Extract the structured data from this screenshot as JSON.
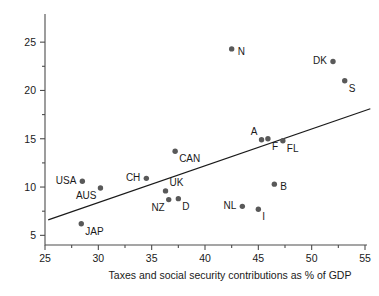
{
  "chart_data": {
    "type": "scatter",
    "title": "",
    "xlabel": "Taxes and social security contributions as % of GDP",
    "ylabel": "",
    "xlim": [
      25,
      55
    ],
    "ylim": [
      4,
      27.5
    ],
    "xticks": [
      25,
      30,
      35,
      40,
      45,
      50,
      55
    ],
    "yticks": [
      5,
      10,
      15,
      20,
      25
    ],
    "xminor": [
      27.5,
      32.5,
      37.5,
      42.5,
      47.5,
      52.5
    ],
    "yminor": [
      7.5,
      12.5,
      17.5,
      22.5
    ],
    "grid": false,
    "legend": "none",
    "points": [
      {
        "label": "USA",
        "x": 28.5,
        "y": 10.6,
        "label_pos": "left"
      },
      {
        "label": "AUS",
        "x": 30.2,
        "y": 9.9,
        "label_pos": "below-left"
      },
      {
        "label": "JAP",
        "x": 28.4,
        "y": 6.2,
        "label_pos": "below-right"
      },
      {
        "label": "CH",
        "x": 34.5,
        "y": 10.9,
        "label_pos": "left"
      },
      {
        "label": "CAN",
        "x": 37.2,
        "y": 13.7,
        "label_pos": "below-right"
      },
      {
        "label": "UK",
        "x": 36.3,
        "y": 9.6,
        "label_pos": "above-right"
      },
      {
        "label": "NZ",
        "x": 36.6,
        "y": 8.7,
        "label_pos": "below-left"
      },
      {
        "label": "D",
        "x": 37.5,
        "y": 8.8,
        "label_pos": "below-right"
      },
      {
        "label": "N",
        "x": 42.5,
        "y": 24.3,
        "label_pos": "right"
      },
      {
        "label": "NL",
        "x": 43.5,
        "y": 8.0,
        "label_pos": "left"
      },
      {
        "label": "I",
        "x": 45.0,
        "y": 7.7,
        "label_pos": "below-right"
      },
      {
        "label": "A",
        "x": 45.3,
        "y": 14.9,
        "label_pos": "above-left"
      },
      {
        "label": "F",
        "x": 45.9,
        "y": 15.0,
        "label_pos": "below-right"
      },
      {
        "label": "FL",
        "x": 47.3,
        "y": 14.8,
        "label_pos": "below-right"
      },
      {
        "label": "B",
        "x": 46.5,
        "y": 10.3,
        "label_pos": "right"
      },
      {
        "label": "DK",
        "x": 52.0,
        "y": 23.0,
        "label_pos": "left"
      },
      {
        "label": "S",
        "x": 53.1,
        "y": 21.0,
        "label_pos": "below-right"
      }
    ],
    "trendline": {
      "x0": 25.3,
      "y0": 6.6,
      "x1": 55.5,
      "y1": 18.1
    }
  },
  "colors": {
    "dot": "#595959",
    "axis": "#4d4d4d",
    "text": "#1a1a1a",
    "trend": "#1a1a1a"
  }
}
